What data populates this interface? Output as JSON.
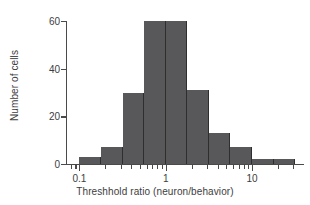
{
  "chart_data": {
    "type": "bar",
    "title": "",
    "subtitle": "",
    "xlabel": "Threshhold ratio (neuron/behavior)",
    "ylabel": "Number of cells",
    "xscale": "log",
    "xlim": [
      0.07,
      40
    ],
    "ylim": [
      0,
      60
    ],
    "grid": false,
    "legend": null,
    "bar_color": "#58585a",
    "axis_color": "#4a4a4a",
    "text_color": "#3d3d3d",
    "x_major_ticks": [
      {
        "value": 0.1,
        "label": "0.1"
      },
      {
        "value": 1,
        "label": "1"
      },
      {
        "value": 10,
        "label": "10"
      }
    ],
    "x_minor_ticks": [
      0.08,
      0.09,
      0.2,
      0.3,
      0.4,
      0.5,
      0.6,
      0.7,
      0.8,
      0.9,
      2,
      3,
      4,
      5,
      6,
      7,
      8,
      9,
      20,
      30
    ],
    "y_ticks": [
      {
        "value": 0,
        "label": "0"
      },
      {
        "value": 20,
        "label": "20"
      },
      {
        "value": 40,
        "label": "40"
      },
      {
        "value": 60,
        "label": "60"
      }
    ],
    "bins": [
      {
        "left": 0.1,
        "right": 0.178,
        "count": 3
      },
      {
        "left": 0.178,
        "right": 0.316,
        "count": 7
      },
      {
        "left": 0.316,
        "right": 0.562,
        "count": 30
      },
      {
        "left": 0.562,
        "right": 1.0,
        "count": 60
      },
      {
        "left": 1.0,
        "right": 1.778,
        "count": 60
      },
      {
        "left": 1.778,
        "right": 3.162,
        "count": 31
      },
      {
        "left": 3.162,
        "right": 5.623,
        "count": 13
      },
      {
        "left": 5.623,
        "right": 10.0,
        "count": 7
      },
      {
        "left": 10.0,
        "right": 17.78,
        "count": 2
      },
      {
        "left": 17.78,
        "right": 31.62,
        "count": 2
      }
    ],
    "categories": [
      "0.1-0.18",
      "0.18-0.32",
      "0.32-0.56",
      "0.56-1.0",
      "1.0-1.78",
      "1.78-3.16",
      "3.16-5.62",
      "5.62-10",
      "10-17.8",
      "17.8-31.6"
    ],
    "values": [
      3,
      7,
      30,
      60,
      60,
      31,
      13,
      7,
      2,
      2
    ]
  }
}
